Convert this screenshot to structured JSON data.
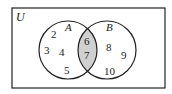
{
  "universe_label": "U",
  "sets": [
    {
      "label": "A",
      "only_elements": [
        "2",
        "3",
        "4",
        "5"
      ]
    },
    {
      "label": "B",
      "only_elements": [
        "8",
        "9",
        "10"
      ]
    }
  ],
  "intersection": {
    "elements": [
      "6",
      "7"
    ],
    "shaded": true,
    "shade_color": "#d0d0d0"
  },
  "colors": {
    "stroke": "#222222",
    "background": "#ffffff"
  }
}
